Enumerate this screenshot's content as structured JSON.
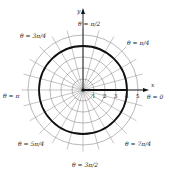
{
  "diagram": {
    "type": "polar-graph",
    "center": {
      "x": 83,
      "y": 90
    },
    "unit_px": 11,
    "grid": {
      "circle_radii": [
        1,
        2,
        3,
        4,
        5
      ],
      "ray_step_degrees": 15,
      "ray_length_units": 5.6,
      "color": "#8a8a8a"
    },
    "curve": {
      "description": "r = 4 circle",
      "radius": 4,
      "color": "#111111"
    },
    "segment": {
      "from_r": 0,
      "to_r": 4,
      "theta": 0
    },
    "axes": {
      "x_label": "x",
      "y_label": "y"
    },
    "radial_tick_labels": [
      "1",
      "2",
      "3",
      "4",
      "5"
    ],
    "angle_labels": [
      {
        "id": "theta-0",
        "text": "θ = 0",
        "x": 147,
        "y": 99
      },
      {
        "id": "theta-pi-4",
        "text": "θ = π/4",
        "x": 132,
        "y": 42
      },
      {
        "id": "theta-pi-2",
        "text": "θ = π/2",
        "x": 86,
        "y": 22
      },
      {
        "id": "theta-3pi-4",
        "text": "θ = 3π/4",
        "x": 24,
        "y": 35
      },
      {
        "id": "theta-pi",
        "text": "θ = π",
        "x": 3,
        "y": 96
      },
      {
        "id": "theta-5pi-4",
        "text": "θ = 5π/4",
        "x": 22,
        "y": 143
      },
      {
        "id": "theta-3pi-2",
        "text": "θ = 3π/2",
        "x": 76,
        "y": 165
      },
      {
        "id": "theta-7pi-4",
        "text": "θ = 7π/4",
        "x": 127,
        "y": 143
      }
    ]
  }
}
